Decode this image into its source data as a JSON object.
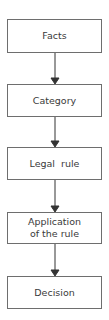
{
  "diagram": {
    "type": "flowchart",
    "direction": "top-to-bottom",
    "colors": {
      "border": "#6e6e6e",
      "text": "#3a3a3a",
      "arrow": "#333333",
      "background": "#ffffff"
    },
    "nodes": [
      {
        "id": "facts",
        "label": "Facts"
      },
      {
        "id": "category",
        "label": "Category"
      },
      {
        "id": "legal-rule",
        "label": "Legal  rule"
      },
      {
        "id": "application",
        "label": "Application of the rule"
      },
      {
        "id": "decision",
        "label": "Decision"
      }
    ],
    "edges": [
      {
        "from": "facts",
        "to": "category"
      },
      {
        "from": "category",
        "to": "legal-rule"
      },
      {
        "from": "legal-rule",
        "to": "application"
      },
      {
        "from": "application",
        "to": "decision"
      }
    ]
  }
}
